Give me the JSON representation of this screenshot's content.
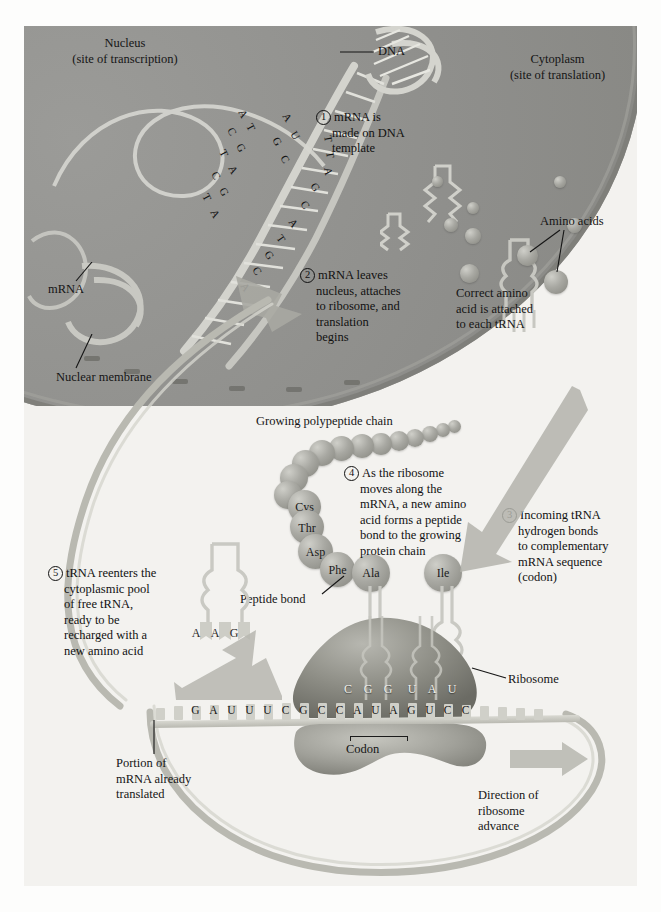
{
  "figure": {
    "regions": {
      "nucleus": {
        "line1": "Nucleus",
        "line2": "(site of transcription)"
      },
      "cytoplasm": {
        "line1": "Cytoplasm",
        "line2": "(site of translation)"
      }
    }
  },
  "labels": {
    "dna": "DNA",
    "mrna_nucleus": "mRNA",
    "nuclear_membrane": "Nuclear membrane",
    "amino_acids": "Amino acids",
    "correct_amino": "Correct amino\nacid is attached\nto each tRNA",
    "correct_amino_l1": "Correct amino",
    "correct_amino_l2": "acid is attached",
    "correct_amino_l3": "to each tRNA",
    "growing_chain": "Growing polypeptide chain",
    "peptide_bond": "Peptide bond",
    "ribosome": "Ribosome",
    "codon": "Codon",
    "portion_l1": "Portion of",
    "portion_l2": "mRNA already",
    "portion_l3": "translated",
    "direction_l1": "Direction of",
    "direction_l2": "ribosome",
    "direction_l3": "advance"
  },
  "steps": [
    {
      "number": "1",
      "lines": [
        "mRNA is",
        "made on DNA",
        "template"
      ]
    },
    {
      "number": "2",
      "lines": [
        "mRNA leaves",
        "nucleus, attaches",
        "to ribosome, and",
        "translation",
        "begins"
      ]
    },
    {
      "number": "3",
      "lines": [
        "Incoming tRNA",
        "hydrogen bonds",
        "to complementary",
        "mRNA sequence",
        "(codon)"
      ]
    },
    {
      "number": "4",
      "lines": [
        "As the ribosome",
        "moves along the",
        "mRNA, a new amino",
        "acid forms a peptide",
        "bond to the growing",
        "protein chain"
      ]
    },
    {
      "number": "5",
      "lines": [
        "tRNA reenters the",
        "cytoplasmic pool",
        "of free tRNA,",
        "ready to be",
        "recharged with a",
        "new amino acid"
      ]
    }
  ],
  "polypeptide": {
    "named_residues": [
      "Cys",
      "Thr",
      "Asp",
      "Phe"
    ],
    "incoming_residues": [
      "Ala",
      "Ile"
    ],
    "unlabeled_bead_count": 12
  },
  "sequences": {
    "mrna_bases": [
      "G",
      "A",
      "U",
      "U",
      "U",
      "C",
      "G",
      "C",
      "C",
      "A",
      "U",
      "A",
      "G",
      "U",
      "C",
      "C"
    ],
    "anticodon_bases": [
      "C",
      "G",
      "G",
      "U",
      "A",
      "U"
    ],
    "free_trna_anticodon": [
      "A",
      "A",
      "G"
    ],
    "dna_template_strand": [
      "A",
      "T",
      "C",
      "G",
      "T",
      "A",
      "C",
      "G",
      "T",
      "A"
    ],
    "dna_coding_strand": [
      "T",
      "T",
      "A",
      "G",
      "C",
      "A",
      "T",
      "G",
      "C",
      "A"
    ]
  },
  "colors": {
    "nucleus_fill": "#8e8e8b",
    "cytoplasm_fill": "#f3f2ef",
    "membrane": "#7d7d78",
    "ribosome_large": "#8e8e86",
    "ribosome_small": "#a0a099",
    "sphere": "#a8a8a2",
    "mrna_strand": "#c6c6be",
    "text": "#151515",
    "arrow": "#b4b4ad"
  }
}
